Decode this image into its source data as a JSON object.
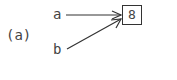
{
  "figure": {
    "label": "(a)",
    "nodes": [
      {
        "id": "a",
        "label": "a"
      },
      {
        "id": "b",
        "label": "b"
      }
    ],
    "target": {
      "value": "8"
    },
    "edges": [
      {
        "from": "a",
        "to": "target"
      },
      {
        "from": "b",
        "to": "target"
      }
    ]
  }
}
